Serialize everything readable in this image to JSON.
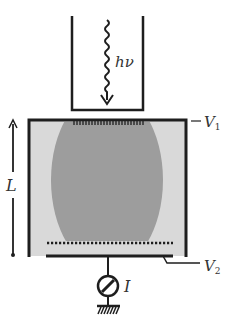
{
  "diagram": {
    "labels": {
      "photon": "hν",
      "top_electrode": "V",
      "top_electrode_sub": "1",
      "bottom_electrode": "V",
      "bottom_electrode_sub": "2",
      "length": "L",
      "current": "I"
    },
    "colors": {
      "line": "#1e1e1e",
      "chamber_fill": "#d9d9d9",
      "cloud_fill": "#9d9d9d",
      "background": "#ffffff"
    }
  }
}
